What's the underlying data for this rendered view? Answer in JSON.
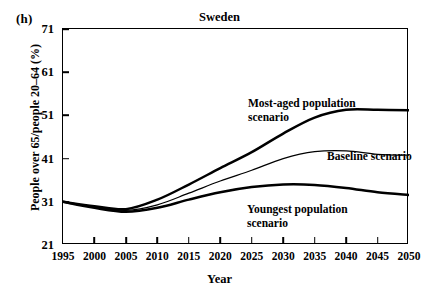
{
  "panel": {
    "label": "(h)"
  },
  "chart_data": {
    "type": "line",
    "title": "Sweden",
    "xlabel": "Year",
    "ylabel": "People over 65/people 20–64 (%)",
    "xlim": [
      1995,
      2050
    ],
    "ylim": [
      21,
      71
    ],
    "xticks": [
      "1995",
      "2000",
      "2005",
      "2010",
      "2015",
      "2020",
      "2025",
      "2030",
      "2035",
      "2040",
      "2045",
      "2050"
    ],
    "yticks": [
      "21",
      "31",
      "41",
      "51",
      "61",
      "71"
    ],
    "grid": false,
    "legend_position": "inline-annotations",
    "x": [
      1995,
      2000,
      2005,
      2010,
      2015,
      2020,
      2025,
      2030,
      2035,
      2040,
      2045,
      2050
    ],
    "series": [
      {
        "name": "Most-aged population scenario",
        "values": [
          31.0,
          30.0,
          29.3,
          31.5,
          35.0,
          38.8,
          42.5,
          46.8,
          50.5,
          52.3,
          52.3,
          52.2
        ]
      },
      {
        "name": "Baseline scenario",
        "values": [
          31.0,
          29.8,
          29.0,
          30.3,
          33.0,
          35.8,
          38.3,
          41.0,
          42.6,
          42.8,
          42.0,
          41.8
        ]
      },
      {
        "name": "Youngest population scenario",
        "values": [
          31.0,
          29.6,
          28.7,
          29.6,
          31.5,
          33.2,
          34.4,
          35.0,
          34.9,
          34.2,
          33.2,
          32.6
        ]
      }
    ],
    "annotations": [
      {
        "text_line1": "Most-aged population",
        "text_line2": "scenario"
      },
      {
        "text_line1": "Baseline scenario",
        "text_line2": ""
      },
      {
        "text_line1": "Youngest population",
        "text_line2": "scenario"
      }
    ]
  }
}
